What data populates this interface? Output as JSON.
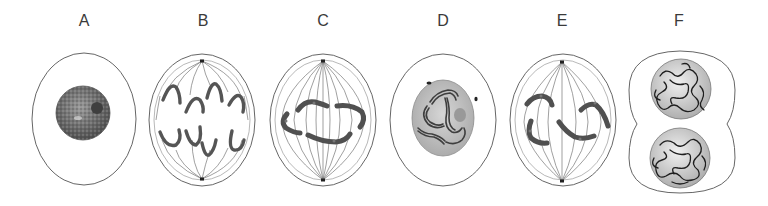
{
  "figure": {
    "colors": {
      "background": "#ffffff",
      "outline": "#555555",
      "spindle": "#6a6a6a",
      "chromosome": "#5c5c5c",
      "chromosome_stroke": "#3a3a3a",
      "nucleus_fill": "#bdbdbd",
      "nucleolus": "#9a9a9a",
      "chromatin_dark": "#4a4a4a"
    },
    "panels": [
      {
        "id": "A",
        "label": "A",
        "x": 84,
        "description": "Interphase cell with granular nucleus and dark nucleolus"
      },
      {
        "id": "B",
        "label": "B",
        "x": 203,
        "description": "Anaphase: V-shaped chromosomes pulled toward opposite poles along spindle fibers"
      },
      {
        "id": "C",
        "label": "C",
        "x": 323,
        "description": "Metaphase-like cell with chromosomes arranged around the spindle equator"
      },
      {
        "id": "D",
        "label": "D",
        "x": 443,
        "description": "Prophase: condensing chromosomes inside nucleus, centrosomes at opposite sides"
      },
      {
        "id": "E",
        "label": "E",
        "x": 562,
        "description": "Prometaphase: chromosomes attaching to spindle fibers"
      },
      {
        "id": "F",
        "label": "F",
        "x": 679,
        "description": "Telophase / cytokinesis: two daughter nuclei, cell pinching in middle"
      }
    ]
  }
}
